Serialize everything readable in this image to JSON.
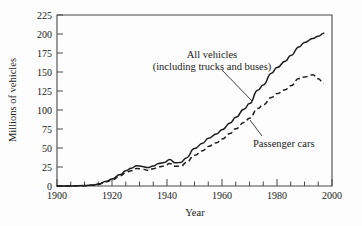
{
  "chart_data": {
    "type": "line",
    "title": "",
    "xlabel": "Year",
    "ylabel": "Millions of vehicles",
    "xlim": [
      1900,
      2000
    ],
    "ylim": [
      0,
      225
    ],
    "grid": false,
    "legend_position": "inline-annotation",
    "x_ticks_major": [
      1900,
      1920,
      1940,
      1960,
      1980,
      2000
    ],
    "x_tick_labels": [
      "1900",
      "1920",
      "1940",
      "1960",
      "1980",
      "2000"
    ],
    "x_tick_minor_step": 5,
    "y_ticks": [
      0,
      25,
      50,
      75,
      100,
      125,
      150,
      175,
      200,
      225
    ],
    "y_tick_labels": [
      "0",
      "25",
      "50",
      "75",
      "100",
      "125",
      "150",
      "175",
      "200",
      "225"
    ],
    "annotations": [
      {
        "name": "all-vehicles",
        "line1": "All vehicles",
        "line2": "(including trucks and buses)",
        "text_x": 212,
        "text_y": 58,
        "leader": "M 222,70 L 252,101"
      },
      {
        "name": "passenger-cars",
        "line1": "Passenger cars",
        "line2": "",
        "text_x": 253,
        "text_y": 143,
        "leader": "M 262,136 L 250,120"
      }
    ],
    "series": [
      {
        "name": "All vehicles (including trucks and buses)",
        "style": "solid",
        "x": [
          1900,
          1905,
          1910,
          1913,
          1915,
          1918,
          1920,
          1923,
          1925,
          1927,
          1929,
          1931,
          1933,
          1935,
          1937,
          1939,
          1941,
          1943,
          1945,
          1947,
          1950,
          1953,
          1955,
          1958,
          1960,
          1963,
          1965,
          1968,
          1970,
          1973,
          1975,
          1978,
          1980,
          1983,
          1985,
          1988,
          1990,
          1993,
          1995,
          1997
        ],
        "y": [
          0,
          0.1,
          0.5,
          1.2,
          2.5,
          6.2,
          9.2,
          15.1,
          20.1,
          23.3,
          26.7,
          25.8,
          24.2,
          26.2,
          29.7,
          31.0,
          34.9,
          30.5,
          31.0,
          37.0,
          49.2,
          56.3,
          62.8,
          68.3,
          73.9,
          83.0,
          90.4,
          100.9,
          108.4,
          126.0,
          132.9,
          148.4,
          155.8,
          164.0,
          171.7,
          183.0,
          188.8,
          194.0,
          197.0,
          201.0
        ],
        "units": "millions"
      },
      {
        "name": "Passenger cars",
        "style": "dashed",
        "x": [
          1900,
          1905,
          1910,
          1913,
          1915,
          1918,
          1920,
          1923,
          1925,
          1927,
          1929,
          1931,
          1933,
          1935,
          1937,
          1939,
          1941,
          1943,
          1945,
          1947,
          1950,
          1953,
          1955,
          1958,
          1960,
          1963,
          1965,
          1968,
          1970,
          1973,
          1975,
          1978,
          1980,
          1983,
          1985,
          1988,
          1990,
          1993,
          1995,
          1997
        ],
        "y": [
          0,
          0.1,
          0.4,
          1.0,
          2.3,
          5.5,
          8.1,
          13.3,
          17.5,
          20.2,
          23.1,
          22.3,
          20.7,
          22.6,
          25.4,
          26.2,
          29.5,
          26.0,
          25.8,
          30.8,
          40.3,
          46.4,
          52.1,
          56.9,
          61.7,
          69.1,
          75.3,
          83.6,
          89.2,
          101.9,
          106.7,
          116.6,
          121.6,
          126.7,
          131.9,
          141.3,
          143.5,
          146.3,
          141.0,
          135.0
        ],
        "units": "millions"
      }
    ]
  },
  "axis": {
    "y_title": "Millions of vehicles",
    "x_title": "Year"
  }
}
